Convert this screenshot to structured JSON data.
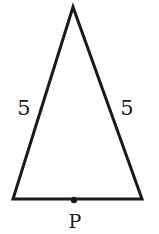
{
  "diagram": {
    "type": "isosceles-triangle",
    "stroke_color": "#1a1a1a",
    "background": "#ffffff",
    "vertices": {
      "apex": [
        73,
        7
      ],
      "bottom_left": [
        13,
        199
      ],
      "bottom_right": [
        142,
        199
      ]
    },
    "side_labels": {
      "left": "5",
      "right": "5"
    },
    "points": [
      {
        "name": "P",
        "label": "P",
        "position": [
          74,
          200
        ],
        "note": "midpoint of base"
      }
    ]
  }
}
